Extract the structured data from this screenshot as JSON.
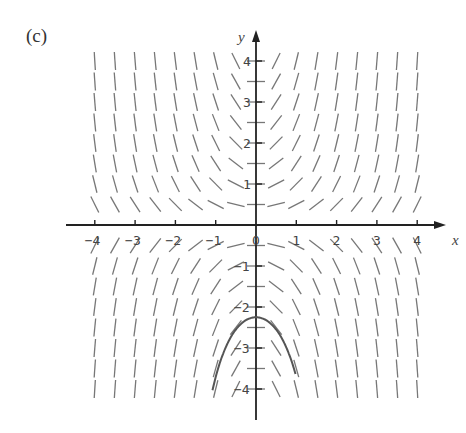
{
  "figure": {
    "panel_label": "(c)",
    "type": "slope_field",
    "x_axis": {
      "label": "x",
      "ticks": [
        "-4",
        "-3",
        "-2",
        "-1",
        "0",
        "1",
        "2",
        "3",
        "4"
      ],
      "range": [
        -4,
        4
      ]
    },
    "y_axis": {
      "label": "y",
      "ticks": [
        "4",
        "3",
        "2",
        "1",
        "-1",
        "-2",
        "-3",
        "-4"
      ],
      "range": [
        -4,
        4
      ]
    },
    "field": {
      "description": "Direction field with slope proportional to x*y",
      "grid_step": 0.5
    },
    "solution_curve": {
      "description": "Solution curve through (0, -2.25) opening downward",
      "peak": [
        0,
        -2.25
      ]
    },
    "colors": {
      "field": "#666666",
      "axes": "#222222",
      "curve": "#555555"
    }
  }
}
